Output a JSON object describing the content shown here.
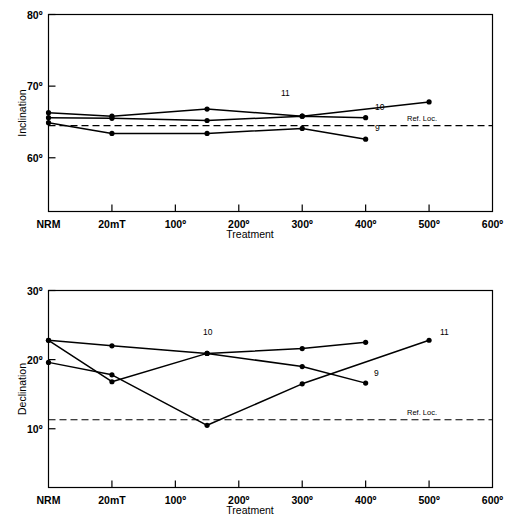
{
  "figure": {
    "title": "",
    "background_color": "#ffffff",
    "line_color": "#000000"
  },
  "chart_data": [
    {
      "type": "line",
      "id": "inclination",
      "title": "",
      "xlabel": "Treatment",
      "ylabel": "Inclination",
      "categories": [
        "NRM",
        "20mT",
        "100º",
        "200º",
        "300º",
        "400º",
        "500º",
        "600º"
      ],
      "x_tick_values": [
        0,
        1,
        2,
        3,
        4,
        5,
        6,
        7
      ],
      "ytick_labels": [
        "80º",
        "70º",
        "60º"
      ],
      "ytick_values": [
        80,
        70,
        60
      ],
      "ylim": [
        52.5,
        80
      ],
      "xlim": [
        0,
        7
      ],
      "grid": false,
      "legend_position": "inline-end-labels",
      "reference_line": {
        "label": "Ref. Loc.",
        "value": 64.5,
        "style": "dashed"
      },
      "series": [
        {
          "name": "9",
          "end_label": "9",
          "x": [
            0,
            1,
            2.5,
            4,
            5
          ],
          "y": [
            64.9,
            63.4,
            63.4,
            64.1,
            62.6
          ]
        },
        {
          "name": "10",
          "end_label": "10",
          "x": [
            0,
            1,
            2.5,
            4,
            5
          ],
          "y": [
            65.6,
            65.5,
            65.2,
            65.8,
            65.6
          ]
        },
        {
          "name": "11",
          "end_label": "11",
          "x": [
            0,
            1,
            2.5,
            4,
            6
          ],
          "y": [
            66.3,
            65.8,
            66.8,
            65.8,
            67.8
          ]
        }
      ]
    },
    {
      "type": "line",
      "id": "declination",
      "title": "",
      "xlabel": "Treatment",
      "ylabel": "Declination",
      "categories": [
        "NRM",
        "20mT",
        "100º",
        "200º",
        "300º",
        "400º",
        "500º",
        "600º"
      ],
      "x_tick_values": [
        0,
        1,
        2,
        3,
        4,
        5,
        6,
        7
      ],
      "ytick_labels": [
        "30º",
        "20º",
        "10º"
      ],
      "ytick_values": [
        30,
        20,
        10
      ],
      "ylim": [
        1.5,
        30
      ],
      "xlim": [
        0,
        7
      ],
      "grid": false,
      "legend_position": "inline-end-labels",
      "reference_line": {
        "label": "Ref. Loc.",
        "value": 11.3,
        "style": "dashed"
      },
      "series": [
        {
          "name": "9",
          "end_label": "9",
          "x": [
            0,
            1,
            2.5,
            4,
            5
          ],
          "y": [
            22.8,
            16.8,
            20.9,
            19.0,
            16.6
          ]
        },
        {
          "name": "10",
          "end_label": "10",
          "x": [
            0,
            1,
            2.5,
            4,
            5
          ],
          "y": [
            22.8,
            22.0,
            20.9,
            21.6,
            22.5
          ]
        },
        {
          "name": "11",
          "end_label": "11",
          "x": [
            0,
            1,
            2.5,
            4,
            6
          ],
          "y": [
            19.6,
            17.8,
            10.5,
            16.5,
            22.8
          ]
        }
      ]
    }
  ]
}
